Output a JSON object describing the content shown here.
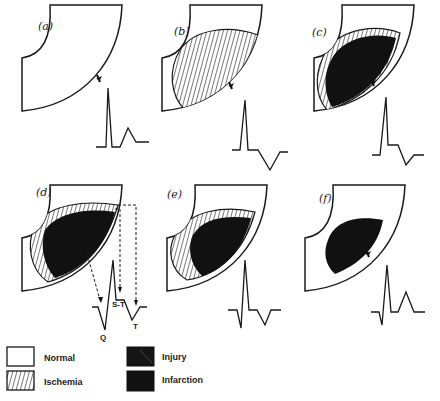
{
  "panels": [
    {
      "id": "a",
      "label": "(a)",
      "state": "normal"
    },
    {
      "id": "b",
      "label": "(b)",
      "state": "ischemia"
    },
    {
      "id": "c",
      "label": "(c)",
      "state": "injury"
    },
    {
      "id": "d",
      "label": "(d)",
      "state": "infarction-acute"
    },
    {
      "id": "e",
      "label": "(e)",
      "state": "infarction-evolving"
    },
    {
      "id": "f",
      "label": "(f)",
      "state": "infarction-old"
    }
  ],
  "ecg_annotations": {
    "q": "Q",
    "st": "S-T",
    "t": "T"
  },
  "legend": [
    {
      "key": "normal",
      "label": "Normal"
    },
    {
      "key": "ischemia",
      "label": "Ischemia"
    },
    {
      "key": "injury",
      "label": "Injury"
    },
    {
      "key": "infarction",
      "label": "Infarction"
    }
  ],
  "colors": {
    "stroke": "#1a1a1a",
    "fill": "#111111",
    "background": "#ffffff"
  }
}
